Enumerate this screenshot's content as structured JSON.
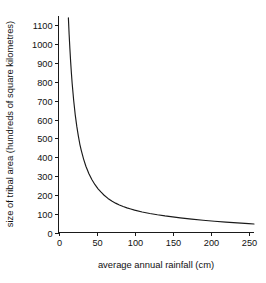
{
  "chart_data": {
    "type": "line",
    "title": "",
    "xlabel": "average annual rainfall (cm)",
    "ylabel": "size of tribal area (hundreds of square kilometres)",
    "xlim": [
      0,
      257
    ],
    "ylim": [
      0,
      1150
    ],
    "grid": false,
    "legend": null,
    "xticks": [
      0,
      50,
      100,
      150,
      200,
      250
    ],
    "xtick_labels": [
      "0",
      "50",
      "100",
      "150",
      "200",
      "250"
    ],
    "yticks": [
      0,
      100,
      200,
      300,
      400,
      500,
      600,
      700,
      800,
      900,
      1000,
      1100
    ],
    "ytick_labels": [
      "0",
      "100",
      "200",
      "300",
      "400",
      "500",
      "600",
      "700",
      "800",
      "900",
      "1000",
      "1100"
    ],
    "series": [
      {
        "name": "tribal area vs rainfall",
        "color": "#1a1a1a",
        "x": [
          13,
          14,
          15,
          16,
          17,
          18,
          20,
          22,
          24,
          26,
          28,
          30,
          33,
          36,
          40,
          44,
          48,
          52,
          56,
          60,
          65,
          70,
          75,
          80,
          85,
          90,
          95,
          100,
          110,
          120,
          130,
          140,
          150,
          160,
          175,
          190,
          205,
          220,
          235,
          250,
          257
        ],
        "y": [
          1140,
          1050,
          975,
          905,
          845,
          790,
          700,
          625,
          565,
          515,
          470,
          435,
          390,
          352,
          312,
          280,
          254,
          232,
          214,
          198,
          181,
          167,
          156,
          146,
          138,
          131,
          125,
          119,
          109,
          101,
          94,
          88,
          83,
          78,
          71,
          65,
          60,
          55,
          51,
          47,
          45
        ]
      }
    ],
    "annotations": []
  },
  "axes": {
    "x_axis_label": "average annual rainfall (cm)",
    "y_axis_label": "size of tribal area (hundreds of square kilometres)"
  }
}
